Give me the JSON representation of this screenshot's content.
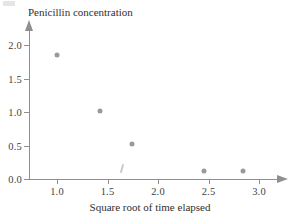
{
  "chart_data": {
    "type": "scatter",
    "title": "",
    "xlabel": "Square root of time elapsed",
    "ylabel": "Penicillin concentration",
    "xlim": [
      0.72,
      3.2
    ],
    "ylim": [
      -0.08,
      2.2
    ],
    "grid": false,
    "legend": null,
    "x_ticks": [
      {
        "value": 1.0,
        "label": "1.0"
      },
      {
        "value": 1.5,
        "label": "1.5"
      },
      {
        "value": 2.0,
        "label": "2.0"
      },
      {
        "value": 2.5,
        "label": "2.5"
      },
      {
        "value": 3.0,
        "label": "3.0"
      }
    ],
    "y_ticks": [
      {
        "value": 0.0,
        "label": "0.0"
      },
      {
        "value": 0.5,
        "label": "0.5"
      },
      {
        "value": 1.0,
        "label": "1.0"
      },
      {
        "value": 1.5,
        "label": "1.5"
      },
      {
        "value": 2.0,
        "label": "2.0"
      }
    ],
    "x": [
      1.0,
      1.43,
      1.74,
      2.46,
      2.84
    ],
    "y": [
      1.85,
      1.02,
      0.52,
      0.13,
      0.12
    ],
    "points": [
      {
        "x": 1.0,
        "y": 1.85
      },
      {
        "x": 1.43,
        "y": 1.02
      },
      {
        "x": 1.74,
        "y": 0.52
      },
      {
        "x": 2.46,
        "y": 0.13
      },
      {
        "x": 2.84,
        "y": 0.12
      }
    ],
    "marker_color": "#9a9a9a",
    "axis_color": "#8f8f8f",
    "text_color": "#2f2f2f"
  },
  "axes": {
    "y_title": "Penicillin concentration",
    "x_title": "Square root of time elapsed"
  }
}
